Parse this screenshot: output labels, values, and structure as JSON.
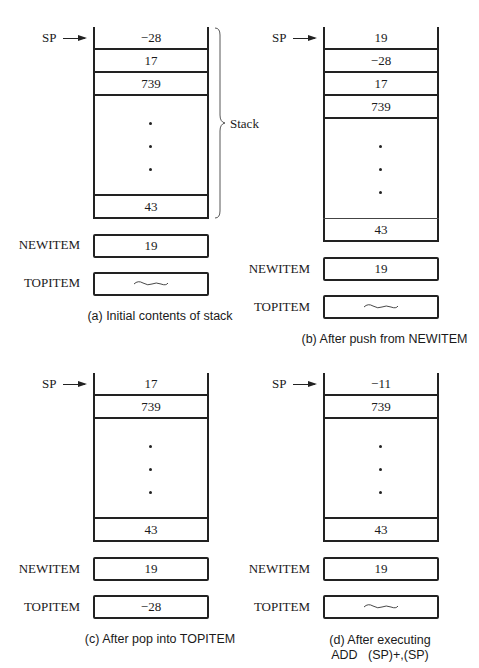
{
  "panels": [
    {
      "id": "a",
      "sp_label": "SP",
      "stack_cells": [
        "−28",
        "17",
        "739"
      ],
      "bottom_cell": "43",
      "newitem_label": "NEWITEM",
      "newitem_value": "19",
      "topitem_label": "TOPITEM",
      "topitem_value": "~~~",
      "stack_brace_label": "Stack",
      "caption": "(a) Initial contents of stack"
    },
    {
      "id": "b",
      "sp_label": "SP",
      "stack_cells": [
        "19",
        "−28",
        "17",
        "739"
      ],
      "bottom_cell": "43",
      "newitem_label": "NEWITEM",
      "newitem_value": "19",
      "topitem_label": "TOPITEM",
      "topitem_value": "~~~",
      "caption": "(b) After push from NEWITEM"
    },
    {
      "id": "c",
      "sp_label": "SP",
      "stack_cells": [
        "17",
        "739"
      ],
      "bottom_cell": "43",
      "newitem_label": "NEWITEM",
      "newitem_value": "19",
      "topitem_label": "TOPITEM",
      "topitem_value": "−28",
      "caption": "(c) After pop into TOPITEM"
    },
    {
      "id": "d",
      "sp_label": "SP",
      "stack_cells": [
        "−11",
        "739"
      ],
      "bottom_cell": "43",
      "newitem_label": "NEWITEM",
      "newitem_value": "19",
      "topitem_label": "TOPITEM",
      "topitem_value": "~~~",
      "caption_line1": "(d) After executing",
      "caption_line2": "ADD   (SP)+,(SP)"
    }
  ]
}
